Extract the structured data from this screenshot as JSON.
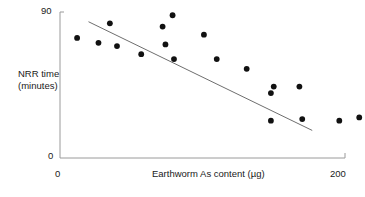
{
  "chart_data": {
    "type": "scatter",
    "title": "",
    "xlabel": "Earthworm As content (µg)",
    "ylabel": "NRR time (minutes)",
    "ylabel_line1": "NRR time",
    "ylabel_line2": "(minutes)",
    "xlim": [
      0,
      200
    ],
    "ylim": [
      0,
      90
    ],
    "xticks": [
      0,
      200
    ],
    "yticks": [
      0,
      90
    ],
    "xtick_labels": [
      "0",
      "200"
    ],
    "ytick_labels": [
      "0",
      "90"
    ],
    "grid": false,
    "legend": false,
    "marker": "filled-circle",
    "marker_color": "#111111",
    "axis_color": "#9a9a9a",
    "trendline_color": "#6e6e6e",
    "points": [
      {
        "x": 12,
        "y": 74
      },
      {
        "x": 27,
        "y": 71
      },
      {
        "x": 35,
        "y": 83
      },
      {
        "x": 40,
        "y": 69
      },
      {
        "x": 57,
        "y": 64
      },
      {
        "x": 72,
        "y": 81
      },
      {
        "x": 74,
        "y": 70
      },
      {
        "x": 79,
        "y": 88
      },
      {
        "x": 80,
        "y": 61
      },
      {
        "x": 101,
        "y": 76
      },
      {
        "x": 110,
        "y": 61
      },
      {
        "x": 131,
        "y": 55
      },
      {
        "x": 150,
        "y": 44
      },
      {
        "x": 148,
        "y": 40
      },
      {
        "x": 168,
        "y": 44
      },
      {
        "x": 148,
        "y": 23
      },
      {
        "x": 170,
        "y": 24
      },
      {
        "x": 196,
        "y": 23
      },
      {
        "x": 210,
        "y": 25
      }
    ],
    "trendline": {
      "x_start": 20,
      "y_start": 84,
      "x_end": 177,
      "y_end": 17
    }
  }
}
